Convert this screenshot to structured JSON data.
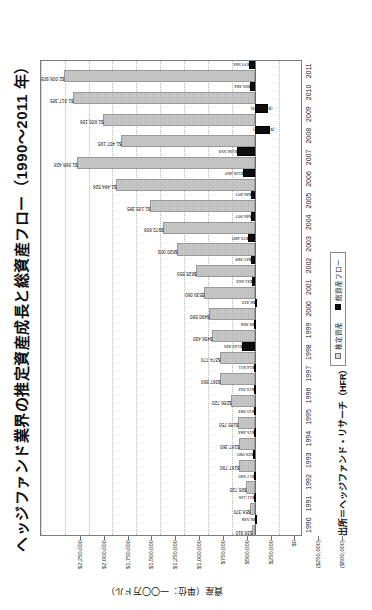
{
  "figure": {
    "title": "ヘッジファンド業界の推定資産成長と総資産フロー（1990～2011 年）",
    "source": "出所＝ヘッジファンド・リサーチ（HFR）",
    "yaxis_title": "資産（単位：一〇〇万ドル）"
  },
  "legend": {
    "items": [
      {
        "label": "推定資産",
        "swatch": "assets",
        "color": "#d8d8d8"
      },
      {
        "label": "総資産フロー",
        "swatch": "flow",
        "color": "#0d0d0d"
      }
    ]
  },
  "chart_data": {
    "type": "bar",
    "title": "ヘッジファンド業界の推定資産成長と総資産フロー（1990～2011 年）",
    "xlabel": "",
    "ylabel": "資産（単位：一〇〇万ドル）",
    "ylim": [
      -500000,
      2250000
    ],
    "grid": true,
    "legend_position": "bottom-center",
    "ytick_labels": [
      "$2,250,000",
      "$2,000,000",
      "$1,750,000",
      "$1,500,000",
      "$1,250,000",
      "$1,000,000",
      "$750,000",
      "$500,000",
      "$250,000",
      "$0",
      "($250,000)",
      "($500,000)"
    ],
    "ytick_values": [
      2250000,
      2000000,
      1750000,
      1500000,
      1250000,
      1000000,
      750000,
      500000,
      250000,
      0,
      -250000,
      -500000
    ],
    "categories": [
      "1990",
      "1991",
      "1992",
      "1993",
      "1994",
      "1995",
      "1996",
      "1997",
      "1998",
      "1999",
      "2000",
      "2001",
      "2002",
      "2003",
      "2004",
      "2005",
      "2006",
      "2007",
      "2008",
      "2009",
      "2010",
      "2011"
    ],
    "series": [
      {
        "name": "推定資産",
        "key": "assets",
        "color": "#c4c4c4",
        "values": [
          38910,
          58370,
          95720,
          167790,
          167360,
          185750,
          256720,
          367560,
          374770,
          456430,
          490580,
          539060,
          625550,
          820009,
          972608,
          1105385,
          1464526,
          1868428,
          1407195,
          1600156,
          1917385,
          2008905
        ],
        "labels": [
          "$38,910",
          "$58,370",
          "$95,720",
          "$167,790",
          "$167,360",
          "$185,750",
          "$256,720",
          "$367,560",
          "$374,770",
          "$456,430",
          "$490,580",
          "$539,060",
          "$625,550",
          "$820,009",
          "$972,608",
          "$1,105,385",
          "$1,464,526",
          "$1,868,428",
          "$1,407,195",
          "$1,600,156",
          "$1,917,385",
          "$2,008,905"
        ]
      },
      {
        "name": "総資産フロー",
        "key": "flow",
        "color": "#0d0d0d",
        "values": [
          8538,
          11126,
          17940,
          29080,
          15484,
          10983,
          13352,
          14811,
          143345,
          9968,
          8322,
          31663,
          47389,
          72480,
          46907,
          46807,
          126460,
          194553,
          -154422,
          -131189,
          55384,
          70584
        ],
        "labels": [
          "$8,538",
          "$11,126",
          "$17,940",
          "$29,080",
          "$15,484",
          "$10,983",
          "$13,352",
          "$14,811",
          "$143,345",
          "$9,968",
          "$8,322",
          "$31,663",
          "$47,389",
          "$72,480",
          "$46,907",
          "$46,807",
          "$126,460",
          "$194,553",
          "($154,422)",
          "($131,189)",
          "$55,384",
          "$70,584"
        ]
      }
    ]
  }
}
